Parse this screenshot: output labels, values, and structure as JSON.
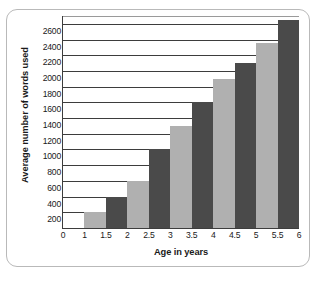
{
  "chart_data": {
    "type": "bar",
    "title": "",
    "xlabel": "Age in years",
    "ylabel": "Average number of words used",
    "categories": [
      "1.5",
      "2",
      "2.5",
      "3",
      "3.5",
      "4",
      "4.5",
      "5",
      "5.5",
      "6"
    ],
    "values": [
      200,
      400,
      600,
      1000,
      1300,
      1600,
      1900,
      2100,
      2350,
      2650
    ],
    "bar_colors": [
      "#b0b0b0",
      "#4a4a4a",
      "#b0b0b0",
      "#4a4a4a",
      "#b0b0b0",
      "#4a4a4a",
      "#b0b0b0",
      "#4a4a4a",
      "#b0b0b0",
      "#4a4a4a"
    ],
    "x_tick_labels": [
      "0",
      "1",
      "1.5",
      "2",
      "2.5",
      "3",
      "3.5",
      "4",
      "4.5",
      "5",
      "5.5",
      "6"
    ],
    "y_tick_labels": [
      "200",
      "400",
      "600",
      "800",
      "1000",
      "1200",
      "1400",
      "1600",
      "1800",
      "2000",
      "2200",
      "2400",
      "2600"
    ],
    "y_tick_values": [
      200,
      400,
      600,
      800,
      1000,
      1200,
      1400,
      1600,
      1800,
      2000,
      2200,
      2400,
      2600
    ],
    "ylim": [
      0,
      2700
    ],
    "grid": true,
    "legend": "none"
  },
  "style": {
    "bar_light": "#b0b0b0",
    "bar_dark": "#4a4a4a",
    "axis_color": "#3d3d3d",
    "frame_color": "#b9b9b9",
    "text_color": "#1a1a1a",
    "background": "#ffffff"
  }
}
